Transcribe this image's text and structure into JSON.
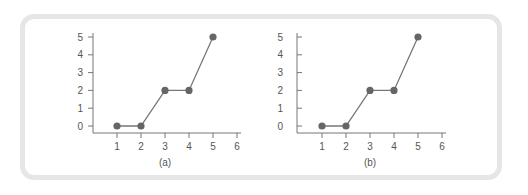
{
  "colors": {
    "frame": "#e6e6e6",
    "axis": "#777777",
    "line": "#777777",
    "marker": "#666666",
    "text": "#555555"
  },
  "chart_data": [
    {
      "type": "line",
      "title": "",
      "caption": "(a)",
      "xlabel": "",
      "ylabel": "",
      "x": [
        1,
        2,
        3,
        4,
        5
      ],
      "y": [
        0,
        0,
        2,
        2,
        5
      ],
      "x_ticks": [
        "1",
        "2",
        "3",
        "4",
        "5",
        "6"
      ],
      "y_ticks": [
        "0",
        "1",
        "2",
        "3",
        "4",
        "5"
      ],
      "xlim": [
        0,
        6
      ],
      "ylim": [
        0,
        5
      ],
      "markers": true,
      "grid": false,
      "legend": null,
      "y_tick_direction": "outward"
    },
    {
      "type": "line",
      "title": "",
      "caption": "(b)",
      "xlabel": "",
      "ylabel": "",
      "x": [
        1,
        2,
        3,
        4,
        5
      ],
      "y": [
        0,
        0,
        2,
        2,
        5
      ],
      "x_ticks": [
        "1",
        "2",
        "3",
        "4",
        "5",
        "6"
      ],
      "y_ticks": [
        "0",
        "1",
        "2",
        "3",
        "4",
        "5"
      ],
      "xlim": [
        0,
        6
      ],
      "ylim": [
        0,
        5
      ],
      "markers": true,
      "grid": false,
      "legend": null,
      "y_tick_direction": "inward"
    }
  ]
}
